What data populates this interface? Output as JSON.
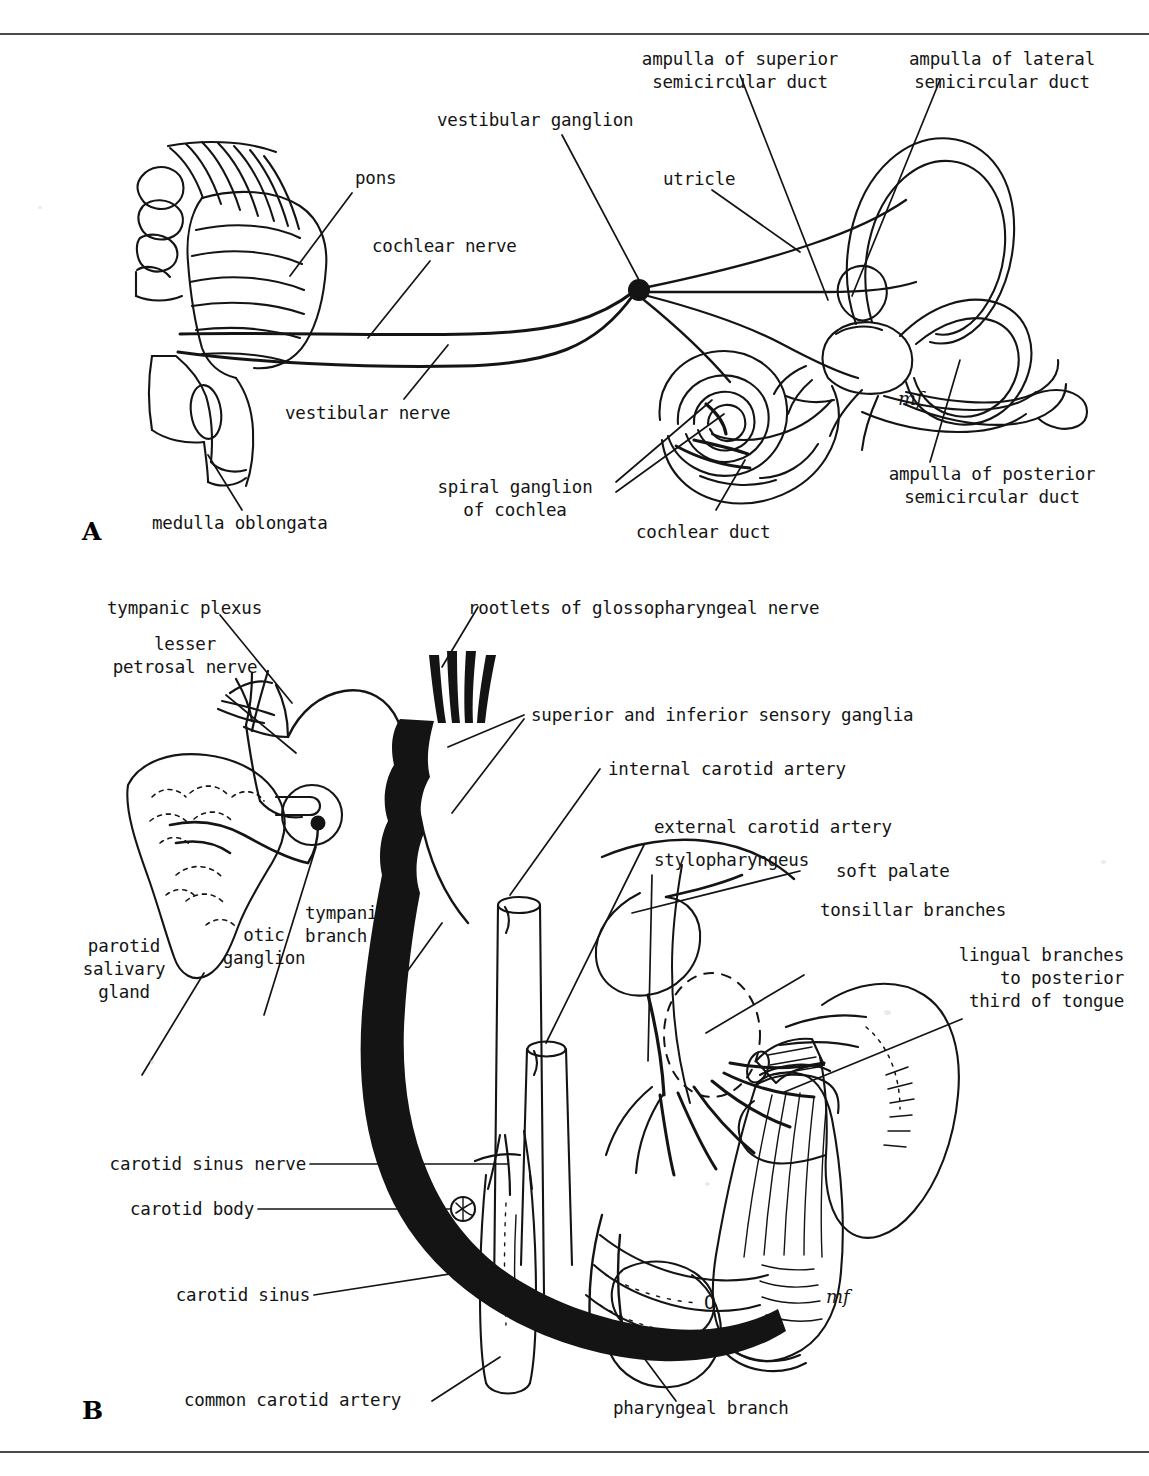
{
  "plate": {
    "panels": [
      {
        "id": "A",
        "letter": "A"
      },
      {
        "id": "B",
        "letter": "B"
      }
    ]
  },
  "panelA": {
    "letter": "A",
    "labels": {
      "pons": "pons",
      "cochlear_nerve": "cochlear nerve",
      "vestibular_ganglion": "vestibular ganglion",
      "vestibular_nerve": "vestibular nerve",
      "medulla_oblongata": "medulla oblongata",
      "spiral_ganglion_l1": "spiral ganglion",
      "spiral_ganglion_l2": "of cochlea",
      "cochlear_duct": "cochlear duct",
      "utricle": "utricle",
      "ampulla_superior_l1": "ampulla of superior",
      "ampulla_superior_l2": "semicircular duct",
      "ampulla_lateral_l1": "ampulla of lateral",
      "ampulla_lateral_l2": "semicircular duct",
      "ampulla_posterior_l1": "ampulla of posterior",
      "ampulla_posterior_l2": "semicircular duct",
      "artist_mark": "mf"
    }
  },
  "panelB": {
    "letter": "B",
    "labels": {
      "tympanic_plexus": "tympanic plexus",
      "lesser_petrosal_l1": "lesser",
      "lesser_petrosal_l2": "petrosal nerve",
      "rootlets": "rootlets of glossopharyngeal nerve",
      "sensory_ganglia": "superior and inferior sensory ganglia",
      "internal_carotid": "internal carotid artery",
      "external_carotid": "external carotid artery",
      "stylopharyngeus": "stylopharyngeus",
      "soft_palate": "soft palate",
      "tonsillar_branches": "tonsillar branches",
      "lingual_branches_l1": "lingual branches",
      "lingual_branches_l2": "to posterior",
      "lingual_branches_l3": "third of tongue",
      "tympanic_branch_l1": "tympanic",
      "tympanic_branch_l2": "branch",
      "otic_ganglion_l1": "otic",
      "otic_ganglion_l2": "ganglion",
      "parotid_l1": "parotid",
      "parotid_l2": "salivary",
      "parotid_l3": "gland",
      "carotid_sinus_nerve": "carotid sinus nerve",
      "carotid_body": "carotid body",
      "carotid_sinus": "carotid sinus",
      "common_carotid": "common carotid artery",
      "pharyngeal_branch": "pharyngeal branch",
      "foramen_mark": "O",
      "artist_mark": "mf"
    }
  },
  "style": {
    "ink": "#141414",
    "paper": "#ffffff",
    "rule": "#4a4a4a"
  }
}
